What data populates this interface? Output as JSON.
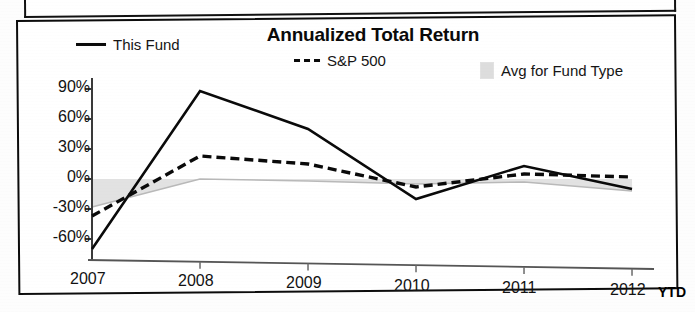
{
  "chart_data": {
    "type": "line",
    "title": "Annualized Total Return",
    "xlabel": "",
    "ylabel": "",
    "x_axis_note": "YTD",
    "categories": [
      "2007",
      "2008",
      "2009",
      "2010",
      "2011",
      "2012"
    ],
    "ylim": [
      -75,
      95
    ],
    "yticks": [
      90,
      60,
      30,
      0,
      -30,
      -60
    ],
    "ytick_labels": [
      "90%",
      "60%",
      "30%",
      "0%",
      "-30%",
      "-60%"
    ],
    "grid": false,
    "legend_position": "top",
    "series": [
      {
        "name": "This Fund",
        "style": "solid",
        "color": "#0a0a0a",
        "values": [
          -70,
          88,
          50,
          -20,
          13,
          -10
        ]
      },
      {
        "name": "S&P 500",
        "style": "dashed",
        "color": "#0a0a0a",
        "values": [
          -37,
          23,
          15,
          -8,
          5,
          2
        ]
      },
      {
        "name": "Avg for Fund Type",
        "style": "area",
        "color": "#dddddd",
        "values": [
          -28,
          0,
          -2,
          -5,
          -3,
          -12
        ]
      }
    ]
  },
  "legend": {
    "this_fund": "This Fund",
    "sp500": "S&P 500",
    "avg_fund_type": "Avg for Fund Type"
  },
  "axis": {
    "ytd_label": "YTD"
  },
  "colors": {
    "line": "#0a0a0a",
    "area_fill": "#dddddd",
    "frame": "#0c0c0c",
    "text": "#121212"
  }
}
